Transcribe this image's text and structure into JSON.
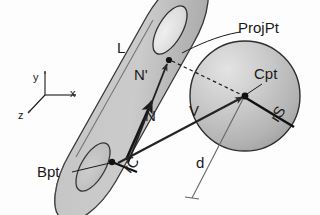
{
  "figure": {
    "background_color": "#fdfdfd",
    "stroke_color": "#1a1a1a",
    "surface_fill": "#b9b9b9",
    "surface_fill_light": "#d8d8d8",
    "labels": {
      "axis_y": "y",
      "axis_x": "x",
      "axis_z": "z",
      "cylinder_axis": "L",
      "normal_prime": "N'",
      "normal": "N",
      "vector_v": "V",
      "distance_d": "d",
      "base_point": "Bpt",
      "cylinder_radius": "rC",
      "sphere_radius": "rS",
      "center_point": "Cpt",
      "projected_point": "ProjPt"
    },
    "elements": [
      {
        "name": "coordinate-axes",
        "kind": "axes"
      },
      {
        "name": "cylinder",
        "kind": "solid"
      },
      {
        "name": "sphere",
        "kind": "solid"
      },
      {
        "name": "normal-vector",
        "kind": "arrow"
      },
      {
        "name": "normal-prime-vector",
        "kind": "arrow"
      },
      {
        "name": "v-vector",
        "kind": "arrow"
      },
      {
        "name": "projection-dashed-line",
        "kind": "dashed"
      },
      {
        "name": "sphere-radius-line",
        "kind": "line"
      },
      {
        "name": "distance-line",
        "kind": "line"
      }
    ]
  }
}
